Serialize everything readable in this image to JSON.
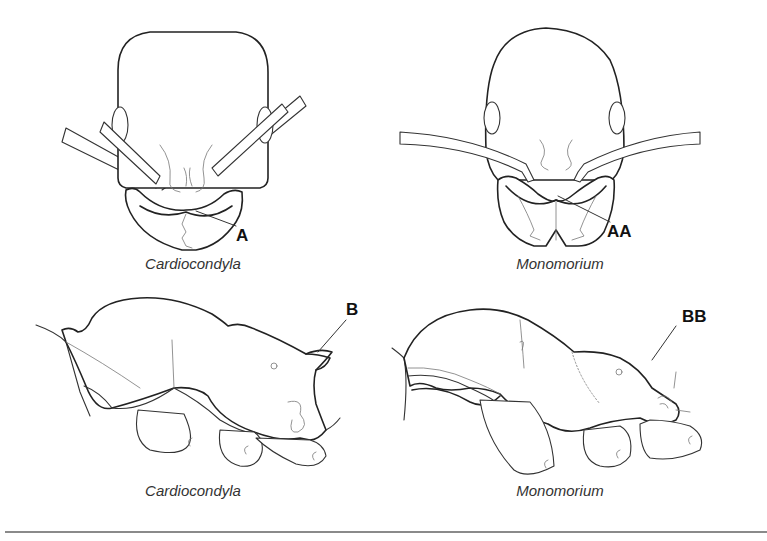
{
  "figure": {
    "panels": [
      {
        "id": "head-cardiocondyla",
        "view": "head, full-face view",
        "caption": "Cardiocondyla",
        "label": "A"
      },
      {
        "id": "head-monomorium",
        "view": "head, full-face view",
        "caption": "Monomorium",
        "label": "AA"
      },
      {
        "id": "mesosoma-cardiocondyla",
        "view": "mesosoma, lateral view",
        "caption": "Cardiocondyla",
        "label": "B"
      },
      {
        "id": "mesosoma-monomorium",
        "view": "mesosoma, lateral view",
        "caption": "Monomorium",
        "label": "BB"
      }
    ],
    "colors": {
      "background": "#ffffff",
      "line": "#222222",
      "caption_text": "#333333",
      "rule": "#8a8a8a"
    }
  }
}
